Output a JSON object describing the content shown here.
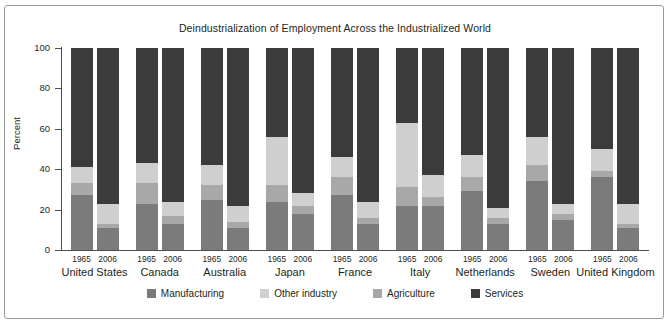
{
  "figure": {
    "title": "Deindustrialization of Employment Across the Industrialized World",
    "ylabel": "Percent"
  },
  "legend": [
    {
      "label": "Manufacturing",
      "color": "#7b7b7b",
      "key": "manufacturing"
    },
    {
      "label": "Other industry",
      "color": "#cfcfcf",
      "key": "other_industry"
    },
    {
      "label": "Agriculture",
      "color": "#a8a8a8",
      "key": "agriculture"
    },
    {
      "label": "Services",
      "color": "#3b3b3b",
      "key": "services"
    }
  ],
  "axis": {
    "ticks": [
      "0",
      "20",
      "40",
      "60",
      "80",
      "100"
    ],
    "ymin": 0,
    "ymax": 100
  },
  "chart_data": {
    "type": "bar",
    "title": "Deindustrialization of Employment Across the Industrialized World",
    "xlabel": "",
    "ylabel": "Percent",
    "ylim": [
      0,
      100
    ],
    "grid": false,
    "stacked": true,
    "legend_position": "bottom",
    "stack_order_bottom_to_top": [
      "Manufacturing",
      "Agriculture",
      "Other industry",
      "Services"
    ],
    "categories": [
      "United States",
      "Canada",
      "Australia",
      "Japan",
      "France",
      "Italy",
      "Netherlands",
      "Sweden",
      "United Kingdom"
    ],
    "years": [
      "1965",
      "2006"
    ],
    "series": [
      {
        "name": "Manufacturing",
        "color": "#7b7b7b",
        "values_1965": [
          27,
          23,
          25,
          24,
          27,
          22,
          29,
          34,
          36
        ],
        "values_2006": [
          11,
          13,
          11,
          18,
          13,
          22,
          13,
          15,
          11
        ]
      },
      {
        "name": "Agriculture",
        "color": "#a8a8a8",
        "values_1965": [
          6,
          10,
          7,
          8,
          9,
          9,
          7,
          8,
          3
        ],
        "values_2006": [
          2,
          4,
          3,
          4,
          3,
          4,
          3,
          3,
          2
        ]
      },
      {
        "name": "Other industry",
        "color": "#cfcfcf",
        "values_1965": [
          8,
          10,
          10,
          24,
          10,
          32,
          11,
          14,
          11
        ],
        "values_2006": [
          10,
          7,
          8,
          6,
          8,
          11,
          5,
          5,
          10
        ]
      },
      {
        "name": "Services",
        "color": "#3b3b3b",
        "values_1965": [
          59,
          57,
          58,
          44,
          54,
          37,
          53,
          44,
          50
        ],
        "values_2006": [
          77,
          76,
          78,
          72,
          76,
          63,
          79,
          77,
          77
        ]
      }
    ],
    "cumulative_tops": {
      "United States": {
        "1965": [
          27,
          33,
          41,
          100
        ],
        "2006": [
          11,
          13,
          23,
          100
        ]
      },
      "Canada": {
        "1965": [
          23,
          33,
          43,
          100
        ],
        "2006": [
          13,
          17,
          24,
          100
        ]
      },
      "Australia": {
        "1965": [
          25,
          32,
          42,
          100
        ],
        "2006": [
          11,
          14,
          22,
          100
        ]
      },
      "Japan": {
        "1965": [
          24,
          32,
          56,
          100
        ],
        "2006": [
          18,
          22,
          28,
          100
        ]
      },
      "France": {
        "1965": [
          27,
          36,
          46,
          100
        ],
        "2006": [
          13,
          16,
          24,
          100
        ]
      },
      "Italy": {
        "1965": [
          22,
          31,
          63,
          100
        ],
        "2006": [
          22,
          26,
          37,
          100
        ]
      },
      "Netherlands": {
        "1965": [
          29,
          36,
          47,
          100
        ],
        "2006": [
          13,
          16,
          21,
          100
        ]
      },
      "Sweden": {
        "1965": [
          34,
          42,
          56,
          100
        ],
        "2006": [
          15,
          18,
          23,
          100
        ]
      },
      "United Kingdom": {
        "1965": [
          36,
          39,
          50,
          100
        ],
        "2006": [
          11,
          13,
          23,
          100
        ]
      }
    }
  }
}
